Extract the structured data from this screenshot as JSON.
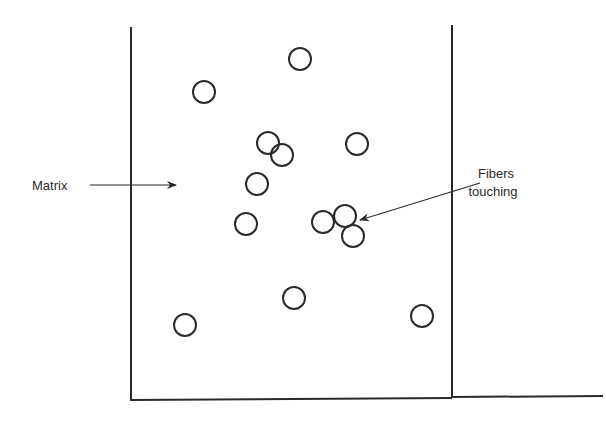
{
  "diagram": {
    "title": "",
    "labels": {
      "matrix": "Matrix",
      "fibers_line1": "Fibers",
      "fibers_line2": "touching"
    },
    "regions": [
      "composite-panel",
      "matrix"
    ],
    "fiber_count": 13,
    "touching_fiber_count": 3,
    "ink_color": "#2a2a2a",
    "background_color": "#ffffff"
  }
}
